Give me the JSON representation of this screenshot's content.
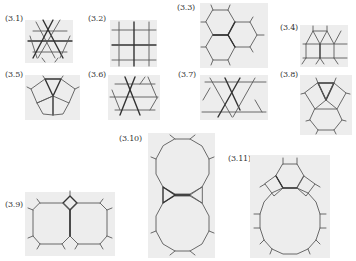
{
  "figures": [
    {
      "id": "3.1",
      "label": "(3.1)",
      "tiling": "triangular"
    },
    {
      "id": "3.2",
      "label": "(3.2)",
      "tiling": "square"
    },
    {
      "id": "3.3",
      "label": "(3.3)",
      "tiling": "hexagonal"
    },
    {
      "id": "3.4",
      "label": "(3.4)",
      "tiling": "elongated-triangular"
    },
    {
      "id": "3.5",
      "label": "(3.5)",
      "tiling": "snub-square"
    },
    {
      "id": "3.6",
      "label": "(3.6)",
      "tiling": "snub-hexagonal"
    },
    {
      "id": "3.7",
      "label": "(3.7)",
      "tiling": "trihexagonal"
    },
    {
      "id": "3.8",
      "label": "(3.8)",
      "tiling": "rhombitrihexagonal"
    },
    {
      "id": "3.9",
      "label": "(3.9)",
      "tiling": "truncated-square"
    },
    {
      "id": "3.10",
      "label": "(3.10)",
      "tiling": "truncated-hexagonal"
    },
    {
      "id": "3.11",
      "label": "(3.11)",
      "tiling": "truncated-trihexagonal"
    }
  ],
  "colors": {
    "panel": "#ededed",
    "line": "#5a5a5a",
    "bold_line": "#333333",
    "background": "#ffffff"
  }
}
